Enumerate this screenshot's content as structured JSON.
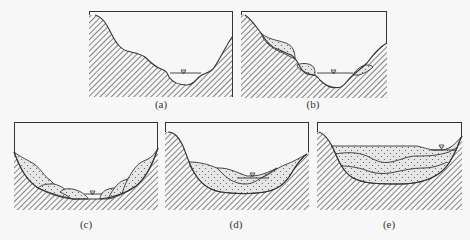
{
  "figure": {
    "colors": {
      "frame": "#333333",
      "line": "#333333",
      "hatch": "#444444",
      "sediment_fill": "#e6e6e6",
      "sediment_dots": "#555555",
      "background": "#f7f7f7"
    },
    "legend_symbols": {
      "bedrock": "diagonal-hatch",
      "sediment": "dotted-fill",
      "water_level": "inverted-triangle"
    },
    "panels": [
      {
        "id": "a",
        "label": "(a)",
        "content": "bare bedrock valley with river at bottom"
      },
      {
        "id": "b",
        "label": "(b)",
        "content": "valley with isolated sediment deposits on slopes"
      },
      {
        "id": "c",
        "label": "(c)",
        "content": "symmetric valley with multiple slope deposit lenses on both sides"
      },
      {
        "id": "d",
        "label": "(d)",
        "content": "valley partially filled with layered sediment"
      },
      {
        "id": "e",
        "label": "(e)",
        "content": "valley fully filled with multiple horizontal sediment layers"
      }
    ]
  }
}
